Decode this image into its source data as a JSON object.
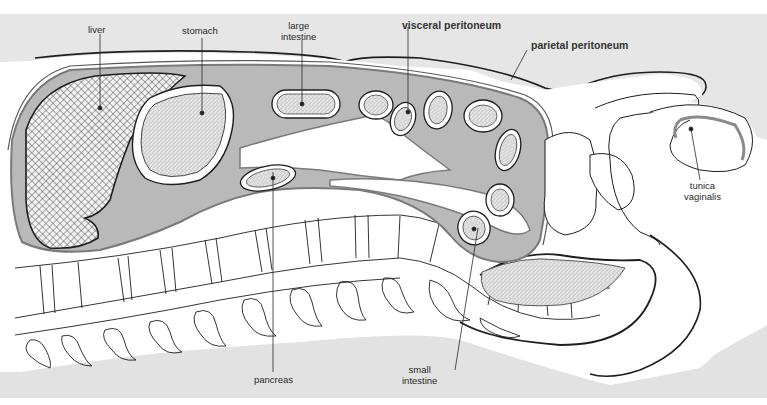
{
  "diagram": {
    "type": "anatomical sagittal section",
    "colors": {
      "background_top": "#e6e6e6",
      "background_bottom": "#e2e2e2",
      "peritoneal_cavity": "#b9b9b9",
      "peritoneum_line": "#7a7a7a",
      "organ_fill": "#dcdcdc",
      "outline": "#1e1e1e",
      "white": "#ffffff"
    },
    "labels": {
      "liver": "liver",
      "stomach": "stomach",
      "large_intestine_line1": "large",
      "large_intestine_line2": "intestine",
      "visceral_peritoneum": "visceral peritoneum",
      "parietal_peritoneum": "parietal peritoneum",
      "tunica_vaginalis_line1": "tunica",
      "tunica_vaginalis_line2": "vaginalis",
      "pancreas": "pancreas",
      "small_intestine_line1": "small",
      "small_intestine_line2": "intestine"
    }
  }
}
